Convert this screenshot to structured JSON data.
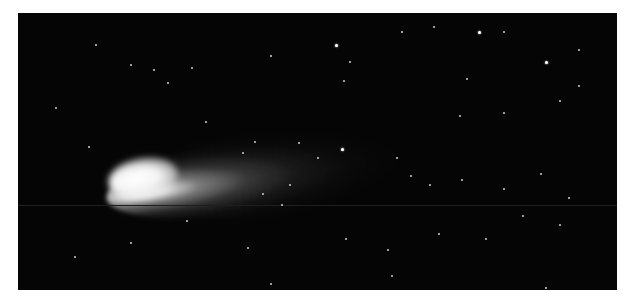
{
  "image": {
    "subject": "comet",
    "description": "Comet with bright coma on the left and a faint tail extending to the upper right against a black star field",
    "background_color": "#050505",
    "coma_color": "#ffffff",
    "border_color": "#ffffff"
  },
  "stars": [
    [
      83,
      35,
      0
    ],
    [
      120,
      57,
      0
    ],
    [
      145,
      62,
      0
    ],
    [
      185,
      60,
      0
    ],
    [
      160,
      77,
      0
    ],
    [
      270,
      47,
      0
    ],
    [
      340,
      34,
      1
    ],
    [
      355,
      53,
      0
    ],
    [
      348,
      75,
      0
    ],
    [
      410,
      20,
      0
    ],
    [
      445,
      14,
      0
    ],
    [
      493,
      20,
      1
    ],
    [
      480,
      72,
      0
    ],
    [
      520,
      20,
      0
    ],
    [
      565,
      53,
      1
    ],
    [
      600,
      80,
      0
    ],
    [
      580,
      97,
      0
    ],
    [
      473,
      113,
      0
    ],
    [
      520,
      110,
      0
    ],
    [
      600,
      40,
      0
    ],
    [
      40,
      105,
      0
    ],
    [
      75,
      148,
      0
    ],
    [
      200,
      120,
      0
    ],
    [
      253,
      142,
      0
    ],
    [
      300,
      143,
      0
    ],
    [
      346,
      150,
      1
    ],
    [
      405,
      160,
      0
    ],
    [
      420,
      180,
      0
    ],
    [
      440,
      190,
      0
    ],
    [
      475,
      185,
      0
    ],
    [
      520,
      195,
      0
    ],
    [
      560,
      178,
      0
    ],
    [
      590,
      205,
      0
    ],
    [
      282,
      212,
      0
    ],
    [
      350,
      250,
      0
    ],
    [
      395,
      262,
      0
    ],
    [
      450,
      245,
      0
    ],
    [
      500,
      250,
      0
    ],
    [
      540,
      225,
      0
    ],
    [
      580,
      235,
      0
    ],
    [
      245,
      260,
      0
    ],
    [
      180,
      230,
      0
    ],
    [
      120,
      255,
      0
    ],
    [
      60,
      270,
      0
    ],
    [
      270,
      300,
      0
    ],
    [
      565,
      305,
      0
    ],
    [
      400,
      291,
      0
    ],
    [
      320,
      160,
      0
    ],
    [
      290,
      190,
      0
    ],
    [
      262,
      200,
      0
    ],
    [
      240,
      155,
      0
    ]
  ]
}
